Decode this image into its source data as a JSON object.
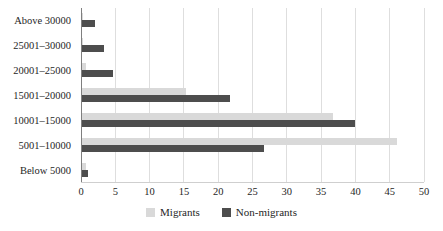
{
  "chart_data": {
    "type": "bar",
    "orientation": "horizontal",
    "title": "",
    "xlabel": "",
    "ylabel": "",
    "categories_display_order": "top-to-bottom",
    "categories": [
      "Above 30000",
      "25001–30000",
      "20001–25000",
      "15001–20000",
      "10001–15000",
      "5001–10000",
      "Below 5000"
    ],
    "series": [
      {
        "name": "Migrants",
        "color": "#d9d9d9",
        "values": [
          0.3,
          0.3,
          0.7,
          15.3,
          36.7,
          46,
          0.7
        ]
      },
      {
        "name": "Non-migrants",
        "color": "#4d4d4d",
        "values": [
          2,
          3.3,
          4.7,
          21.7,
          40,
          26.7,
          1
        ]
      }
    ],
    "xlim": [
      0,
      50
    ],
    "xticks": [
      0,
      5,
      10,
      15,
      20,
      25,
      30,
      35,
      40,
      45,
      50
    ],
    "grid": "vertical",
    "legend_position": "bottom"
  },
  "colors": {
    "background": "#ffffff",
    "gridline": "#dedede",
    "axis_line": "#7f7f7f",
    "value_axis_line": "#cfcfcf",
    "text": "#262626",
    "migrants_bar": "#d9d9d9",
    "non_migrants_bar": "#4d4d4d"
  }
}
